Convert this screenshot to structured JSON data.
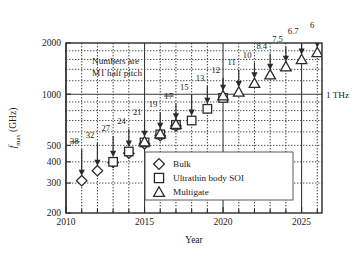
{
  "chart_data": {
    "type": "scatter",
    "title": "",
    "xlabel": "Year",
    "ylabel": "f_max (GHz)",
    "ylabel_main": "f",
    "ylabel_sub": "max",
    "ylabel_unit": " (GHz)",
    "xlim": [
      2010,
      2026.3
    ],
    "ylim": [
      200,
      2000
    ],
    "yscale": "log",
    "grid": true,
    "legend_position": "center-right-lower",
    "xticks_major": [
      2010,
      2015,
      2020,
      2025
    ],
    "xticklabels": [
      "2010",
      "2015",
      "2020",
      "2025"
    ],
    "xticks_minor": [
      2011,
      2012,
      2013,
      2014,
      2016,
      2017,
      2018,
      2019,
      2021,
      2022,
      2023,
      2024,
      2026
    ],
    "yticks": [
      200,
      300,
      400,
      500,
      1000,
      2000
    ],
    "yticklabels": [
      "200",
      "300",
      "400",
      "500",
      "1000",
      "2000"
    ],
    "yticks_minor": [
      600,
      700,
      800,
      900,
      1200,
      1400,
      1600,
      1800
    ],
    "annotation_note": [
      "Numbers are",
      "M1 half pitch"
    ],
    "reference_line": {
      "value": 1000,
      "label": "1 THz"
    },
    "series": [
      {
        "name": "Bulk",
        "marker": "diamond",
        "points": [
          {
            "x": 2011,
            "y": 310
          },
          {
            "x": 2012,
            "y": 355
          },
          {
            "x": 2013,
            "y": 397
          },
          {
            "x": 2014,
            "y": 450
          },
          {
            "x": 2015,
            "y": 510
          },
          {
            "x": 2016,
            "y": 570
          },
          {
            "x": 2017,
            "y": 650
          }
        ]
      },
      {
        "name": "Ultrathin body SOI",
        "marker": "square",
        "points": [
          {
            "x": 2013,
            "y": 400
          },
          {
            "x": 2014,
            "y": 460
          },
          {
            "x": 2015,
            "y": 520
          },
          {
            "x": 2016,
            "y": 580
          },
          {
            "x": 2017,
            "y": 660
          },
          {
            "x": 2018,
            "y": 700
          },
          {
            "x": 2019,
            "y": 820
          },
          {
            "x": 2020,
            "y": 950
          }
        ]
      },
      {
        "name": "Multigate",
        "marker": "triangle",
        "points": [
          {
            "x": 2015,
            "y": 525
          },
          {
            "x": 2016,
            "y": 585
          },
          {
            "x": 2017,
            "y": 665
          },
          {
            "x": 2020,
            "y": 980
          },
          {
            "x": 2021,
            "y": 1030
          },
          {
            "x": 2022,
            "y": 1160
          },
          {
            "x": 2023,
            "y": 1300
          },
          {
            "x": 2024,
            "y": 1450
          },
          {
            "x": 2025,
            "y": 1600
          },
          {
            "x": 2026,
            "y": 1760
          }
        ]
      }
    ],
    "point_labels": [
      {
        "text": "38",
        "x": 2011,
        "y": 500
      },
      {
        "text": "32",
        "x": 2012,
        "y": 545
      },
      {
        "text": "27",
        "x": 2013,
        "y": 600
      },
      {
        "text": "24",
        "x": 2014,
        "y": 660
      },
      {
        "text": "21",
        "x": 2015,
        "y": 740
      },
      {
        "text": "19",
        "x": 2016,
        "y": 830
      },
      {
        "text": "17",
        "x": 2017,
        "y": 930
      },
      {
        "text": "15",
        "x": 2018,
        "y": 1050
      },
      {
        "text": "13",
        "x": 2019,
        "y": 1180
      },
      {
        "text": "12",
        "x": 2020,
        "y": 1320
      },
      {
        "text": "11",
        "x": 2021,
        "y": 1470
      },
      {
        "text": "10",
        "x": 2022,
        "y": 1620
      },
      {
        "text": "8.4",
        "x": 2023,
        "y": 1820
      },
      {
        "text": "7.5",
        "x": 2024,
        "y": 2010
      },
      {
        "text": "6.7",
        "x": 2025,
        "y": 2220
      },
      {
        "text": "6",
        "x": 2026,
        "y": 2420
      }
    ]
  },
  "legend": {
    "items": [
      {
        "label": "Bulk",
        "marker": "diamond"
      },
      {
        "label": "Ultrathin body SOI",
        "marker": "square"
      },
      {
        "label": "Multigate",
        "marker": "triangle"
      }
    ]
  },
  "colors": {
    "background": "#ffffff",
    "ink": "#2a2a2a",
    "grid": "#3a3a3a"
  }
}
